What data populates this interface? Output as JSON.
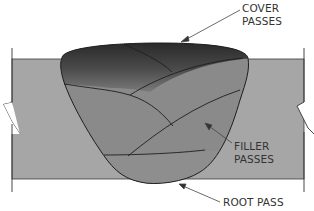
{
  "diagram": {
    "type": "weld-cross-section",
    "labels": {
      "cover": {
        "line1": "COVER",
        "line2": "PASSES"
      },
      "filler": {
        "line1": "FILLER",
        "line2": "PASSES"
      },
      "root": {
        "line1": "ROOT PASS"
      }
    },
    "colors": {
      "base_plate": "#a6a6a6",
      "weld_filler": "#8a8a8a",
      "cover_dark": "#2e2e2e",
      "outline": "#1e1e1e",
      "text": "#333333"
    }
  }
}
